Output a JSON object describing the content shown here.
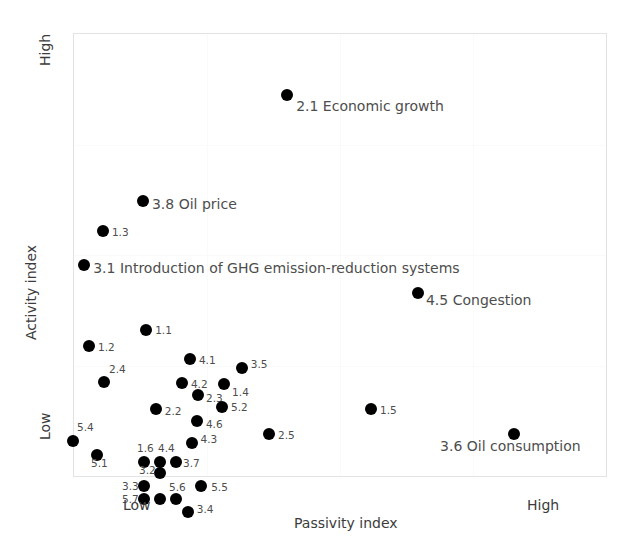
{
  "chart_data": {
    "type": "scatter",
    "title": "",
    "subtitle": "",
    "xlabel": "Passivity index",
    "ylabel": "Activity index",
    "x_tick_labels": [
      "Low",
      "High"
    ],
    "y_tick_labels": [
      "High",
      "Low"
    ],
    "xlim": [
      0,
      100
    ],
    "ylim": [
      0,
      100
    ],
    "grid": true,
    "legend": "none",
    "points": [
      {
        "id": "2.1",
        "label": "2.1 Economic growth",
        "x": 40.1,
        "y": 86.0,
        "label_size": "big",
        "label_dx": 9,
        "label_dy": 9
      },
      {
        "id": "3.8",
        "label": "3.8 Oil price",
        "x": 13.1,
        "y": 62.2,
        "label_size": "big",
        "label_dx": 9,
        "label_dy": 1
      },
      {
        "id": "1.3",
        "label": "1.3",
        "x": 5.6,
        "y": 55.4,
        "label_size": "small",
        "label_dx": 9,
        "label_dy": 1
      },
      {
        "id": "3.1",
        "label": "3.1 Introduction of GHG emission-reduction systems",
        "x": 2.1,
        "y": 47.7,
        "label_size": "big",
        "label_dx": 9,
        "label_dy": 1
      },
      {
        "id": "4.5",
        "label": "4.5 Congestion",
        "x": 64.6,
        "y": 41.4,
        "label_size": "big",
        "label_dx": 8,
        "label_dy": 5
      },
      {
        "id": "1.1",
        "label": "1.1",
        "x": 13.7,
        "y": 33.1,
        "label_size": "small",
        "label_dx": 9,
        "label_dy": 0
      },
      {
        "id": "1.2",
        "label": "1.2",
        "x": 3.0,
        "y": 29.5,
        "label_size": "small",
        "label_dx": 9,
        "label_dy": 1
      },
      {
        "id": "4.1",
        "label": "4.1",
        "x": 21.9,
        "y": 26.6,
        "label_size": "small",
        "label_dx": 9,
        "label_dy": 1
      },
      {
        "id": "3.5",
        "label": "3.5",
        "x": 31.6,
        "y": 24.6,
        "label_size": "small",
        "label_dx": 9,
        "label_dy": -4
      },
      {
        "id": "2.4",
        "label": "2.4",
        "x": 5.8,
        "y": 21.4,
        "label_size": "small",
        "label_dx": 5,
        "label_dy": -13
      },
      {
        "id": "4.2",
        "label": "4.2",
        "x": 20.4,
        "y": 21.2,
        "label_size": "small",
        "label_dx": 9,
        "label_dy": 1
      },
      {
        "id": "1.4",
        "label": "1.4",
        "x": 28.3,
        "y": 21.0,
        "label_size": "small",
        "label_dx": 8,
        "label_dy": 8
      },
      {
        "id": "2.3",
        "label": "2.3",
        "x": 23.4,
        "y": 18.5,
        "label_size": "small",
        "label_dx": 8,
        "label_dy": 3
      },
      {
        "id": "5.2",
        "label": "5.2",
        "x": 27.9,
        "y": 15.8,
        "label_size": "small",
        "label_dx": 9,
        "label_dy": 0
      },
      {
        "id": "2.2",
        "label": "2.2",
        "x": 15.5,
        "y": 15.3,
        "label_size": "small",
        "label_dx": 9,
        "label_dy": 2
      },
      {
        "id": "1.5",
        "label": "1.5",
        "x": 55.8,
        "y": 15.3,
        "label_size": "small",
        "label_dx": 9,
        "label_dy": 1
      },
      {
        "id": "4.6",
        "label": "4.6",
        "x": 23.2,
        "y": 12.6,
        "label_size": "small",
        "label_dx": 9,
        "label_dy": 3
      },
      {
        "id": "5.4",
        "label": "5.4",
        "x": 0.0,
        "y": 8.1,
        "label_size": "small",
        "label_dx": 4,
        "label_dy": -14
      },
      {
        "id": "2.5",
        "label": "2.5",
        "x": 36.7,
        "y": 9.6,
        "label_size": "small",
        "label_dx": 9,
        "label_dy": 1
      },
      {
        "id": "3.6",
        "label": "3.6 Oil consumption",
        "x": 82.6,
        "y": 9.6,
        "label_size": "big",
        "label_dx": -74,
        "label_dy": 10
      },
      {
        "id": "4.3",
        "label": "4.3",
        "x": 22.2,
        "y": 7.7,
        "label_size": "small",
        "label_dx": 9,
        "label_dy": -4
      },
      {
        "id": "5.1",
        "label": "5.1",
        "x": 4.5,
        "y": 5.0,
        "label_size": "small",
        "label_dx": -6,
        "label_dy": 8
      },
      {
        "id": "1.6",
        "label": "1.6",
        "x": 13.3,
        "y": 3.4,
        "label_size": "small",
        "label_dx": -7,
        "label_dy": -14
      },
      {
        "id": "4.4",
        "label": "4.4",
        "x": 16.3,
        "y": 3.4,
        "label_size": "small",
        "label_dx": -2,
        "label_dy": -14
      },
      {
        "id": "3.7",
        "label": "3.7",
        "x": 19.3,
        "y": 3.4,
        "label_size": "small",
        "label_dx": 7,
        "label_dy": 1
      },
      {
        "id": "3.2",
        "label": "3.2",
        "x": 16.3,
        "y": 0.9,
        "label_size": "small",
        "label_dx": -21,
        "label_dy": -3
      },
      {
        "id": "3.3",
        "label": "3.3",
        "x": 13.3,
        "y": -2.1,
        "label_size": "small",
        "label_dx": -22,
        "label_dy": 0
      },
      {
        "id": "5.5",
        "label": "5.5",
        "x": 24.0,
        "y": -2.1,
        "label_size": "small",
        "label_dx": 10,
        "label_dy": 1
      },
      {
        "id": "5.7",
        "label": "5.7",
        "x": 13.3,
        "y": -5.0,
        "label_size": "small",
        "label_dx": -22,
        "label_dy": 0
      },
      {
        "id": "5.6",
        "label": "5.6",
        "x": 19.3,
        "y": -5.0,
        "label_size": "small",
        "label_dx": -7,
        "label_dy": -12
      },
      {
        "id": "5.6b",
        "label": "",
        "x": 16.3,
        "y": -5.0,
        "label_size": "small",
        "label_dx": 0,
        "label_dy": 0
      },
      {
        "id": "3.4",
        "label": "3.4",
        "x": 21.5,
        "y": -7.9,
        "label_size": "small",
        "label_dx": 9,
        "label_dy": -3
      }
    ]
  },
  "axes": {
    "x_low": "Low",
    "x_high": "High",
    "x_title": "Passivity index",
    "y_high": "High",
    "y_low": "Low",
    "y_title": "Activity index"
  },
  "style": {
    "point_color": "#000000",
    "label_color": "#4d4d4d",
    "axis_color": "#3c3c3c",
    "frame_color": "#e3e3e3",
    "background": "#ffffff"
  }
}
